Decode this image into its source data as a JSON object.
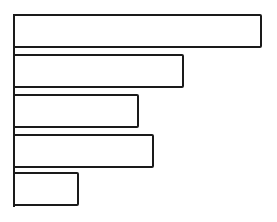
{
  "chart_data": {
    "type": "bar",
    "orientation": "horizontal",
    "title": "",
    "xlabel": "",
    "ylabel": "",
    "categories": [
      "1",
      "2",
      "3",
      "4",
      "5"
    ],
    "values": [
      247,
      169,
      124,
      139,
      64
    ],
    "units": "relative length (no axis scale shown)",
    "grid": false,
    "legend": null,
    "style": {
      "fill": "#ffffff",
      "stroke": "#1a1a1a"
    }
  },
  "layout": {
    "origin_x": 13,
    "bar_tops": [
      14,
      54,
      94,
      134,
      172
    ],
    "bar_height": 30
  }
}
